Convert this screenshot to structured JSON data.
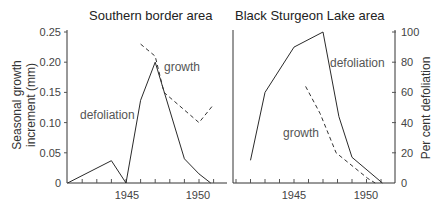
{
  "chart_data": [
    {
      "type": "line",
      "title": "Southern border area",
      "xlabel": "",
      "ylabel": "Seasonal growth increment (mm)",
      "x_ticks_labeled": [
        1945,
        1950
      ],
      "xlim": [
        1941,
        1952
      ],
      "ylim": [
        0,
        0.25
      ],
      "y_ticks": [
        0,
        0.05,
        0.1,
        0.15,
        0.2,
        0.25
      ],
      "y_tick_labels": [
        "0",
        "0.05",
        "0.10",
        "0.15",
        "0.20",
        "0.25"
      ],
      "grid": false,
      "legend": "inline labels",
      "series": [
        {
          "name": "defoliation",
          "style": "solid",
          "x": [
            1941,
            1944,
            1945,
            1946,
            1947,
            1949,
            1950,
            1950.8
          ],
          "y": [
            0,
            0.037,
            0,
            0.137,
            0.2,
            0.04,
            0.015,
            0
          ]
        },
        {
          "name": "growth",
          "style": "dashed",
          "x": [
            1946,
            1947,
            1947.6,
            1950,
            1951
          ],
          "y": [
            0.23,
            0.21,
            0.15,
            0.1,
            0.13
          ]
        }
      ],
      "annotations": [
        {
          "text": "growth",
          "x": 1947.4,
          "y": 0.19
        },
        {
          "text": "defoliation",
          "x": 1941.9,
          "y": 0.112
        }
      ]
    },
    {
      "type": "line",
      "title": "Black Sturgeon Lake area",
      "xlabel": "",
      "ylabel": "Per cent defoliation",
      "x_ticks_labeled": [
        1945,
        1950
      ],
      "xlim": [
        1940.8,
        1952.6
      ],
      "ylim": [
        0,
        100
      ],
      "y_ticks": [
        0,
        20,
        40,
        60,
        80,
        100
      ],
      "y_tick_labels": [
        "0",
        "20",
        "40",
        "60",
        "80",
        "100"
      ],
      "grid": false,
      "legend": "inline labels",
      "series": [
        {
          "name": "defoliation",
          "style": "solid",
          "x": [
            1942,
            1943,
            1945,
            1947,
            1948.1,
            1949,
            1951.1
          ],
          "y": [
            15,
            60,
            90,
            100,
            44,
            17,
            0
          ]
        },
        {
          "name": "growth",
          "style": "dashed",
          "x": [
            1945.8,
            1946.8,
            1947.9,
            1950.1,
            1950.6
          ],
          "y": [
            64,
            46,
            20,
            3,
            0
          ]
        }
      ],
      "annotations": [
        {
          "text": "defoliation",
          "x": 1947.8,
          "y": 80
        },
        {
          "text": "growth",
          "x": 1944.2,
          "y": 36
        }
      ]
    }
  ],
  "figure": {
    "left_title": "Southern border area",
    "right_title": "Black Sturgeon Lake area",
    "left_ylabel_line1": "Seasonal growth",
    "left_ylabel_line2": "increment (mm)",
    "right_ylabel": "Per cent defoliation",
    "left_labels": {
      "growth": "growth",
      "defoliation": "defoliation"
    },
    "right_labels": {
      "growth": "growth",
      "defoliation": "defoliation"
    },
    "x_label_1945": "1945",
    "x_label_1950": "1950"
  }
}
